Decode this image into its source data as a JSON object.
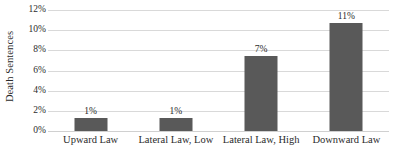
{
  "chart_data": {
    "type": "bar",
    "title": "",
    "xlabel": "",
    "ylabel": "Death Sentences",
    "categories": [
      "Upward Law",
      "Lateral Law, Low",
      "Lateral Law, High",
      "Downward Law"
    ],
    "values": [
      1.3,
      1.3,
      7.4,
      10.7
    ],
    "data_labels": [
      "1%",
      "1%",
      "7%",
      "11%"
    ],
    "ylim": [
      0,
      12
    ],
    "ytick_values": [
      0,
      2,
      4,
      6,
      8,
      10,
      12
    ],
    "ytick_labels": [
      "0%",
      "2%",
      "4%",
      "6%",
      "8%",
      "10%",
      "12%"
    ],
    "grid": true,
    "legend": "none",
    "bar_color": "#595959",
    "gridline_color": "#d9d9d9",
    "text_color": "#2b2b2b",
    "background_color": "#ffffff"
  }
}
